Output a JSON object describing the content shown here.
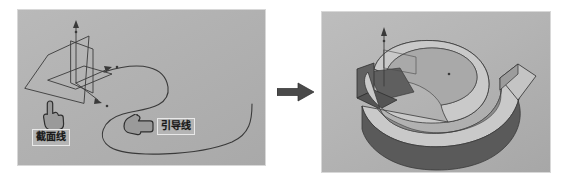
{
  "figure": {
    "type": "cad-swept-surface-illustration",
    "panel_count": 2,
    "colors": {
      "page_background": "#ffffff",
      "panel_background": "#b3b3b3",
      "panel_border": "#d8d8d8",
      "line_stroke": "#3a3a3a",
      "label_background": "#b5b5b5",
      "label_border": "#e9e9e9",
      "label_text": "#1a1a1a",
      "arrow_fill": "#4a4a4a",
      "surface_top": "#c9c9c9",
      "surface_side_dark": "#5a5a5a",
      "surface_side_mid": "#8c8c8c",
      "hand_fill": "#9a9a9a",
      "hand_outline": "#2f2f2f"
    }
  },
  "left_panel": {
    "name": "input-curves-view",
    "labels": [
      {
        "id": "section",
        "text": "截面线",
        "meaning": "cross-section line"
      },
      {
        "id": "guide",
        "text": "引导线",
        "meaning": "guide line"
      }
    ],
    "cursors": [
      {
        "id": "section-hand",
        "icon": "hand-pointing-up-icon"
      },
      {
        "id": "guide-hand",
        "icon": "hand-pointing-left-icon"
      }
    ],
    "geometry": {
      "section_profile": "quadrilateral-planar-sketch",
      "guide_curve": "s-shaped-spline",
      "axes": [
        "z-axis-arrow",
        "x-axis-arrow",
        "y-axis-arrow"
      ]
    }
  },
  "flow": {
    "arrow": "right-arrow-icon",
    "direction": "left-to-right"
  },
  "right_panel": {
    "name": "swept-surface-result-view",
    "geometry": {
      "result": "swept-ribbon-surface",
      "sweep_path": "s-shaped-spline",
      "profile": "vertical-plate",
      "axes": [
        "z-axis-arrow"
      ]
    }
  }
}
